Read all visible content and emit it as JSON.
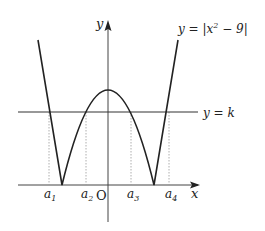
{
  "diagram": {
    "curve_label": "y = |x² − 9|",
    "curve_label_parts": {
      "pre": "y = |x",
      "sup": "2",
      "post": " − 9|"
    },
    "line_label": "y = k",
    "axis_x_label": "x",
    "axis_y_label": "y",
    "origin_label": "O",
    "points": [
      {
        "base": "a",
        "sub": "1"
      },
      {
        "base": "a",
        "sub": "2"
      },
      {
        "base": "a",
        "sub": "3"
      },
      {
        "base": "a",
        "sub": "4"
      }
    ]
  }
}
